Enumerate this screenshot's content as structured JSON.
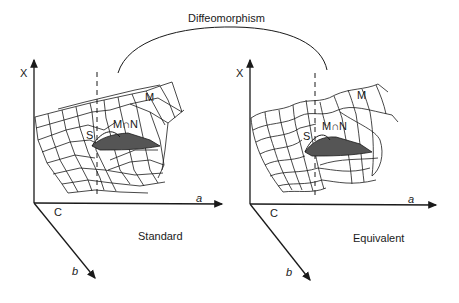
{
  "title": "Diffeomorphism",
  "colors": {
    "ink": "#1a1a1a",
    "fold_fill": "#555555",
    "background": "#ffffff"
  },
  "left_panel": {
    "caption": "Standard",
    "axes": {
      "vertical": "X",
      "horizontal": "a",
      "depth": "b",
      "origin": "C"
    },
    "surface_label": "M",
    "intersection_label": "M∩N",
    "fold_label": "S"
  },
  "right_panel": {
    "caption": "Equivalent",
    "axes": {
      "vertical": "X",
      "horizontal": "a",
      "depth": "b",
      "origin": "C"
    },
    "surface_label": "M",
    "intersection_label": "M∩N",
    "fold_label": "S"
  }
}
